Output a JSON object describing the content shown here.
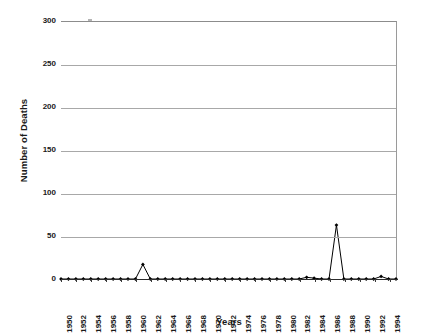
{
  "chart_data": {
    "type": "line",
    "title": "",
    "xlabel": "Years",
    "ylabel": "Number of Deaths",
    "xlim": [
      1950,
      1995
    ],
    "ylim": [
      0,
      300
    ],
    "yticks": [
      0,
      50,
      100,
      150,
      200,
      250,
      300
    ],
    "xticks": [
      1950,
      1952,
      1954,
      1956,
      1958,
      1960,
      1962,
      1964,
      1966,
      1968,
      1970,
      1972,
      1974,
      1976,
      1978,
      1980,
      1982,
      1984,
      1986,
      1988,
      1990,
      1992,
      1994
    ],
    "grid": true,
    "grid_axis": "y",
    "legend": false,
    "marker": "filled-diamond",
    "line_color": "#000000",
    "marker_color": "#000000",
    "grid_color": "#a8a8a8",
    "axis_color": "#2b2b2b",
    "background": "#ffffff",
    "x": [
      1950,
      1951,
      1952,
      1953,
      1954,
      1955,
      1956,
      1957,
      1958,
      1959,
      1960,
      1961,
      1962,
      1963,
      1964,
      1965,
      1966,
      1967,
      1968,
      1969,
      1970,
      1971,
      1972,
      1973,
      1974,
      1975,
      1976,
      1977,
      1978,
      1979,
      1980,
      1981,
      1982,
      1983,
      1984,
      1985,
      1986,
      1987,
      1988,
      1989,
      1990,
      1991,
      1992,
      1993,
      1994,
      1995
    ],
    "values": [
      0,
      0,
      0,
      0,
      0,
      0,
      0,
      0,
      0,
      0,
      0,
      17,
      0,
      0,
      0,
      0,
      0,
      0,
      0,
      0,
      0,
      0,
      0,
      0,
      0,
      0,
      0,
      0,
      0,
      0,
      0,
      0,
      0,
      2,
      1,
      0,
      0,
      63,
      0,
      0,
      0,
      0,
      0,
      3,
      0,
      0
    ]
  }
}
